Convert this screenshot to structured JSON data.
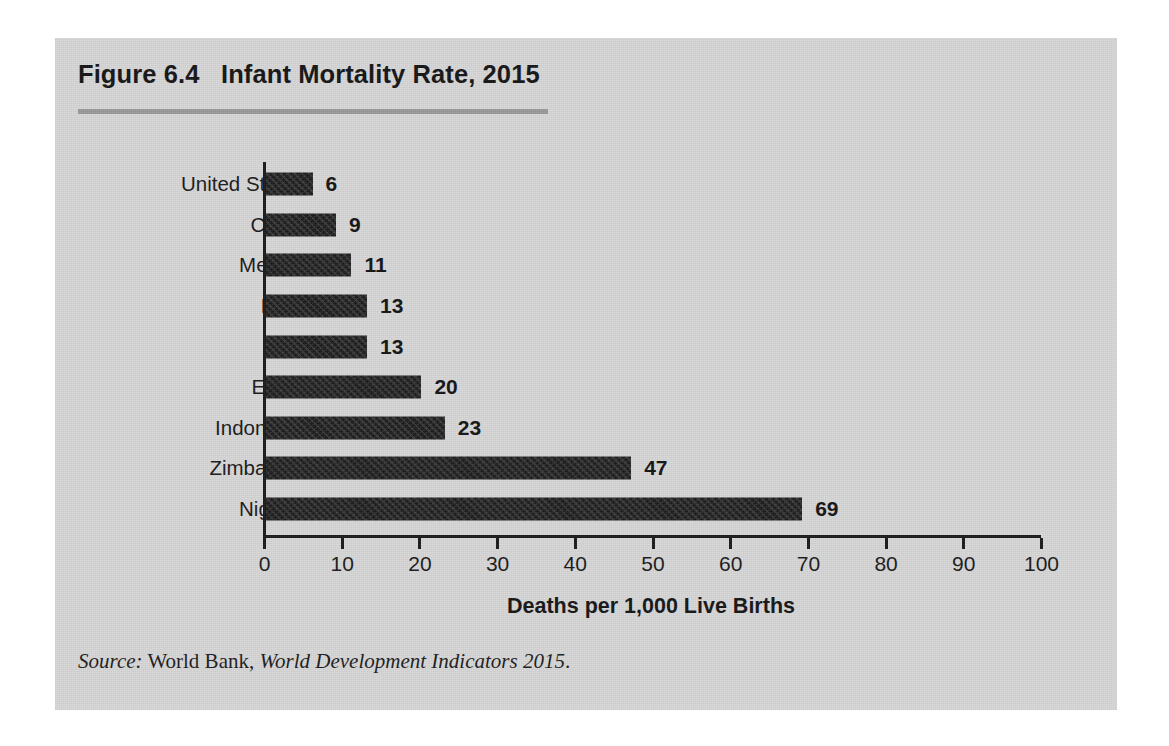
{
  "figure": {
    "title": "Figure 6.4   Infant Mortality Rate, 2015",
    "title_label": "Figure 6.4",
    "title_text": "Infant Mortality Rate, 2015",
    "panel_color": "#d7d7d7",
    "rule_color": "#9a9a9a",
    "bar_color": "#1d1d1d",
    "axis_color": "#1b1b1b"
  },
  "source": {
    "prefix": "Source:",
    "publisher": " World Bank, ",
    "work": "World Development Indicators 2015",
    "end": "."
  },
  "chart_data": {
    "type": "bar",
    "orientation": "horizontal",
    "title": "Figure 6.4   Infant Mortality Rate, 2015",
    "subtitle": "",
    "xlabel": "Deaths per 1,000 Live Births",
    "ylabel": "",
    "categories": [
      "United States",
      "China",
      "Mexico",
      "Peru",
      "Iran",
      "Egypt",
      "Indonesia",
      "Zimbabwe",
      "Nigeria"
    ],
    "values": [
      6,
      9,
      11,
      13,
      13,
      20,
      23,
      47,
      69
    ],
    "value_labels": [
      "6",
      "9",
      "11",
      "13",
      "13",
      "20",
      "23",
      "47",
      "69"
    ],
    "xlim": [
      0,
      100
    ],
    "xticks": [
      0,
      10,
      20,
      30,
      40,
      50,
      60,
      70,
      80,
      90,
      100
    ],
    "xtick_labels": [
      "0",
      "10",
      "20",
      "30",
      "40",
      "50",
      "60",
      "70",
      "80",
      "90",
      "100"
    ],
    "grid": false,
    "legend": null,
    "units": "deaths per 1,000 live births"
  }
}
